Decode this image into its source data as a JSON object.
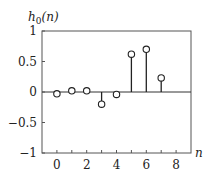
{
  "chart_data": {
    "type": "stem",
    "title": "",
    "ylabel": "h0(n)",
    "ylabel_main": "h",
    "ylabel_sub": "0",
    "ylabel_arg": "(n)",
    "xlabel": "n",
    "xlim": [
      -1,
      9
    ],
    "ylim": [
      -1,
      1
    ],
    "xticks": [
      0,
      2,
      4,
      6,
      8
    ],
    "xtick_labels": [
      "0",
      "2",
      "4",
      "6",
      "8"
    ],
    "minor_xticks": [
      0,
      1,
      2,
      3,
      4,
      5,
      6,
      7,
      8
    ],
    "yticks": [
      1,
      0.5,
      0,
      -0.5,
      -1
    ],
    "ytick_labels": [
      "1",
      "0.5",
      "0",
      "−0.5",
      "−1"
    ],
    "grid": false,
    "legend": null,
    "x": [
      0,
      1,
      2,
      3,
      4,
      5,
      6,
      7
    ],
    "values": [
      -0.03,
      0.02,
      0.02,
      -0.2,
      -0.04,
      0.62,
      0.7,
      0.23
    ],
    "marker": "open-circle",
    "color": "#222222"
  }
}
